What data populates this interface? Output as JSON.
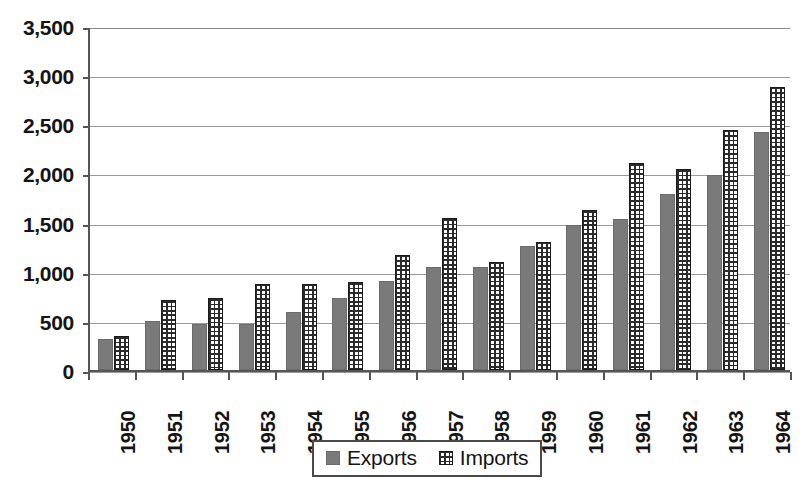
{
  "chart_data": {
    "type": "bar",
    "title": "",
    "xlabel": "",
    "ylabel": "",
    "grid": true,
    "legend_position": "bottom-center",
    "ylim": [
      0,
      3500
    ],
    "ytick_labels": [
      "0",
      "500",
      "1,000",
      "1,500",
      "2,000",
      "2,500",
      "3,000",
      "3,500"
    ],
    "ytick_values": [
      0,
      500,
      1000,
      1500,
      2000,
      2500,
      3000,
      3500
    ],
    "categories": [
      "1950",
      "1951",
      "1952",
      "1953",
      "1954",
      "1955",
      "1956",
      "1957",
      "1958",
      "1959",
      "1960",
      "1961",
      "1962",
      "1963",
      "1964"
    ],
    "series": [
      {
        "name": "Exports",
        "pattern": "solid-gray",
        "color": "#7a7a7a",
        "values": [
          320,
          500,
          465,
          465,
          595,
          730,
          905,
          1050,
          1045,
          1265,
          1480,
          1535,
          1790,
          1985,
          2420
        ]
      },
      {
        "name": "Imports",
        "pattern": "grid-hatch",
        "color": "#2b2b2b",
        "values": [
          350,
          710,
          730,
          875,
          875,
          895,
          1175,
          1550,
          1100,
          1305,
          1630,
          2105,
          2045,
          2440,
          2875
        ]
      }
    ]
  },
  "legend": {
    "entries": [
      {
        "label": "Exports",
        "swatch": "solid-gray-swatch"
      },
      {
        "label": "Imports",
        "swatch": "grid-hatch-swatch"
      }
    ]
  }
}
